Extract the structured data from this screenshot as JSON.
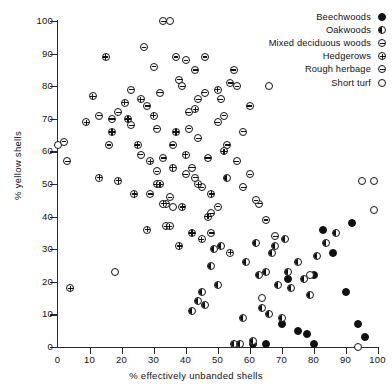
{
  "chart_data": {
    "type": "scatter",
    "title": "",
    "xlabel": "% effectively unbanded shells",
    "ylabel": "% yellow shells",
    "xlim": [
      0,
      100
    ],
    "ylim": [
      0,
      100
    ],
    "xticks": [
      0,
      10,
      20,
      30,
      40,
      50,
      60,
      70,
      80,
      90,
      100
    ],
    "yticks": [
      0,
      10,
      20,
      30,
      40,
      50,
      60,
      70,
      80,
      90,
      100
    ],
    "grid": false,
    "legend_position": "top-right",
    "series": [
      {
        "name": "Beechwoods",
        "marker": "filled-circle",
        "color": "#111111",
        "points": [
          [
            61,
            1
          ],
          [
            65,
            1
          ],
          [
            70,
            7
          ],
          [
            72,
            21
          ],
          [
            75,
            5
          ],
          [
            78,
            4
          ],
          [
            80,
            1
          ],
          [
            80,
            22
          ],
          [
            83,
            36
          ],
          [
            86,
            29
          ],
          [
            90,
            17
          ],
          [
            92,
            38
          ],
          [
            94,
            7
          ],
          [
            96,
            3
          ]
        ]
      },
      {
        "name": "Oakwoods",
        "marker": "half-filled-circle",
        "color": "#111111",
        "points": [
          [
            42,
            11
          ],
          [
            44,
            14
          ],
          [
            45,
            17
          ],
          [
            46,
            13
          ],
          [
            48,
            25
          ],
          [
            49,
            30
          ],
          [
            50,
            19
          ],
          [
            51,
            31
          ],
          [
            53,
            52
          ],
          [
            55,
            1
          ],
          [
            57,
            1
          ],
          [
            58,
            9
          ],
          [
            59,
            26
          ],
          [
            61,
            2
          ],
          [
            62,
            32
          ],
          [
            63,
            22
          ],
          [
            64,
            12
          ],
          [
            65,
            23
          ],
          [
            66,
            10
          ],
          [
            67,
            29
          ],
          [
            68,
            31
          ],
          [
            69,
            19
          ],
          [
            70,
            9
          ],
          [
            71,
            33
          ],
          [
            72,
            23
          ],
          [
            73,
            18
          ],
          [
            75,
            26
          ],
          [
            77,
            21
          ],
          [
            79,
            16
          ],
          [
            81,
            28
          ],
          [
            84,
            32
          ],
          [
            87,
            35
          ]
        ]
      },
      {
        "name": "Mixed deciduous woods",
        "marker": "barred-circle",
        "color": "#555555",
        "points": [
          [
            17,
            70
          ],
          [
            19,
            72
          ],
          [
            23,
            68
          ],
          [
            26,
            59
          ],
          [
            28,
            74
          ],
          [
            29,
            47
          ],
          [
            31,
            67
          ],
          [
            32,
            78
          ],
          [
            33,
            58
          ],
          [
            34,
            44
          ],
          [
            36,
            62
          ],
          [
            38,
            82
          ],
          [
            39,
            80
          ],
          [
            40,
            53
          ],
          [
            41,
            72
          ],
          [
            42,
            55
          ],
          [
            43,
            85
          ],
          [
            44,
            64
          ],
          [
            45,
            49
          ],
          [
            46,
            78
          ],
          [
            47,
            58
          ],
          [
            48,
            41
          ],
          [
            50,
            69
          ],
          [
            51,
            76
          ],
          [
            53,
            62
          ],
          [
            55,
            85
          ],
          [
            56,
            57
          ],
          [
            58,
            49
          ],
          [
            60,
            74
          ],
          [
            63,
            44
          ]
        ]
      },
      {
        "name": "Hedgerows",
        "marker": "crossed-circle",
        "color": "#333333",
        "points": [
          [
            4,
            18
          ],
          [
            9,
            69
          ],
          [
            11,
            77
          ],
          [
            13,
            52
          ],
          [
            15,
            89
          ],
          [
            17,
            66
          ],
          [
            19,
            51
          ],
          [
            21,
            75
          ],
          [
            22,
            70
          ],
          [
            24,
            47
          ],
          [
            25,
            62
          ],
          [
            26,
            76
          ],
          [
            28,
            36
          ],
          [
            29,
            57
          ],
          [
            30,
            71
          ],
          [
            31,
            50
          ],
          [
            32,
            50
          ],
          [
            33,
            44
          ],
          [
            34,
            37
          ],
          [
            35,
            37
          ],
          [
            36,
            55
          ],
          [
            37,
            66
          ],
          [
            38,
            31
          ],
          [
            39,
            43
          ],
          [
            40,
            59
          ],
          [
            42,
            35
          ],
          [
            43,
            73
          ],
          [
            44,
            50
          ],
          [
            45,
            33
          ],
          [
            47,
            40
          ],
          [
            48,
            47
          ],
          [
            50,
            79
          ],
          [
            52,
            60
          ],
          [
            54,
            29
          ]
        ]
      },
      {
        "name": "Rough herbage",
        "marker": "open-barred-circle",
        "color": "#444444",
        "points": [
          [
            2,
            63
          ],
          [
            3,
            57
          ],
          [
            13,
            71
          ],
          [
            16,
            62
          ],
          [
            23,
            79
          ],
          [
            27,
            92
          ],
          [
            30,
            86
          ],
          [
            31,
            54
          ],
          [
            33,
            100
          ],
          [
            35,
            46
          ],
          [
            37,
            89
          ],
          [
            40,
            88
          ],
          [
            41,
            67
          ],
          [
            43,
            52
          ],
          [
            44,
            76
          ],
          [
            46,
            89
          ],
          [
            48,
            35
          ],
          [
            50,
            43
          ],
          [
            52,
            71
          ],
          [
            54,
            81
          ],
          [
            56,
            80
          ],
          [
            58,
            66
          ],
          [
            60,
            53
          ],
          [
            62,
            45
          ],
          [
            65,
            39
          ],
          [
            68,
            34
          ]
        ]
      },
      {
        "name": "Short turf",
        "marker": "open-circle",
        "color": "#111111",
        "points": [
          [
            0,
            62
          ],
          [
            18,
            23
          ],
          [
            35,
            100
          ],
          [
            36,
            43
          ],
          [
            64,
            15
          ],
          [
            66,
            80
          ],
          [
            79,
            22
          ],
          [
            94,
            0
          ],
          [
            95,
            51
          ],
          [
            99,
            51
          ],
          [
            99,
            42
          ]
        ]
      }
    ]
  },
  "legend": {
    "items": [
      {
        "label": "Beechwoods",
        "marker_class": "m-beechwoods",
        "icon_name": "filled-circle-icon"
      },
      {
        "label": "Oakwoods",
        "marker_class": "m-oakwoods",
        "icon_name": "half-filled-circle-icon"
      },
      {
        "label": "Mixed deciduous woods",
        "marker_class": "m-mixed",
        "icon_name": "barred-circle-icon"
      },
      {
        "label": "Hedgerows",
        "marker_class": "m-hedgerows",
        "icon_name": "crossed-circle-icon"
      },
      {
        "label": "Rough herbage",
        "marker_class": "m-rough",
        "icon_name": "open-barred-circle-icon"
      },
      {
        "label": "Short turf",
        "marker_class": "m-short",
        "icon_name": "open-circle-icon"
      }
    ]
  }
}
